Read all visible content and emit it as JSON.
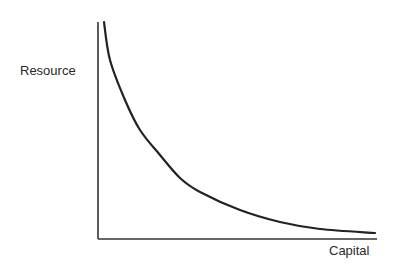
{
  "chart_data": {
    "type": "line",
    "title": "",
    "xlabel": "Capital",
    "ylabel": "Resource",
    "grid": false,
    "legend": null,
    "xticks": [],
    "yticks": [],
    "series": [
      {
        "name": "isoquant",
        "color": "#222222",
        "points_px": [
          [
            104,
            22
          ],
          [
            110,
            60
          ],
          [
            125,
            100
          ],
          [
            140,
            130
          ],
          [
            160,
            155
          ],
          [
            180,
            178
          ],
          [
            200,
            192
          ],
          [
            240,
            210
          ],
          [
            280,
            222
          ],
          [
            320,
            229
          ],
          [
            375,
            233
          ]
        ],
        "x": [
          0.02,
          0.04,
          0.1,
          0.15,
          0.22,
          0.29,
          0.37,
          0.51,
          0.65,
          0.8,
          0.99
        ],
        "y": [
          1.0,
          0.82,
          0.64,
          0.5,
          0.39,
          0.28,
          0.22,
          0.13,
          0.08,
          0.05,
          0.03
        ]
      }
    ],
    "axis_px": {
      "origin": [
        98,
        239
      ],
      "y_top": 22,
      "x_right": 377
    },
    "colors": {
      "axis": "#333333",
      "curve": "#222222",
      "text": "#2a2a2a"
    }
  }
}
